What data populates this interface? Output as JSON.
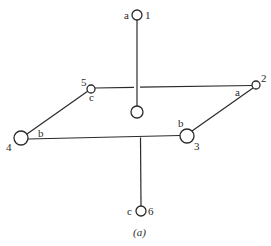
{
  "diagram": {
    "caption": "(a)",
    "stroke_color": "#2a2a2a",
    "nodes": [
      {
        "id": "1",
        "label": "1",
        "port": "a"
      },
      {
        "id": "2",
        "label": "2",
        "port": "a"
      },
      {
        "id": "3",
        "label": "3",
        "port": "b"
      },
      {
        "id": "4",
        "label": "4",
        "port": "b"
      },
      {
        "id": "5",
        "label": "5",
        "port": "c"
      },
      {
        "id": "6",
        "label": "6",
        "port": "c"
      },
      {
        "id": "center",
        "label": "",
        "port": ""
      }
    ],
    "edges": [
      {
        "from": "1",
        "to": "center",
        "crosses": "5-2 (gap)"
      },
      {
        "from": "5",
        "to": "2"
      },
      {
        "from": "4",
        "to": "5"
      },
      {
        "from": "4",
        "to": "3"
      },
      {
        "from": "3",
        "to": "2"
      },
      {
        "from": "4-3 line",
        "to": "6"
      }
    ]
  }
}
